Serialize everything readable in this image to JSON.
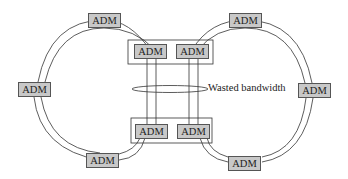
{
  "diagram": {
    "node_label": "ADM",
    "annotation": "Wasted bandwidth",
    "nodes": {
      "top_left": "ADM",
      "top_right": "ADM",
      "inner_top_left": "ADM",
      "inner_top_right": "ADM",
      "left": "ADM",
      "right": "ADM",
      "inner_bottom_left": "ADM",
      "inner_bottom_right": "ADM",
      "bottom_left": "ADM",
      "bottom_right": "ADM"
    },
    "colors": {
      "node_fill": "#c8c8c8",
      "line": "#333333"
    }
  }
}
